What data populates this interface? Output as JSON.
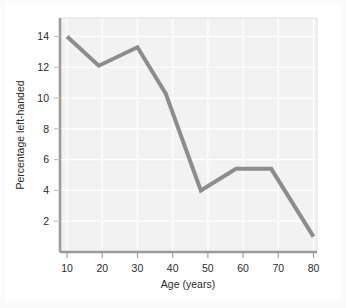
{
  "chart_data": {
    "type": "line",
    "title": "",
    "xlabel": "Age (years)",
    "ylabel": "Percentage left-handed",
    "xlim": [
      8,
      81
    ],
    "ylim": [
      0,
      15.2
    ],
    "xticks": [
      10,
      20,
      30,
      40,
      50,
      60,
      70,
      80
    ],
    "yticks": [
      2,
      4,
      6,
      8,
      10,
      12,
      14
    ],
    "xtick_labels": [
      "10",
      "20",
      "30",
      "40",
      "50",
      "60",
      "70",
      "80"
    ],
    "ytick_labels": [
      "2",
      "4",
      "6",
      "8",
      "10",
      "12",
      "14"
    ],
    "grid": true,
    "legend": "none",
    "series": [
      {
        "name": "Percentage left-handed",
        "x": [
          10,
          19,
          30,
          38,
          48,
          58,
          68,
          80
        ],
        "values": [
          14.0,
          12.1,
          13.3,
          10.3,
          4.0,
          5.4,
          5.4,
          1.0
        ]
      }
    ],
    "colors": {
      "line": "#8d8d8d",
      "plot_background": "#f2f2f2",
      "grid": "#ffffff",
      "axis": "#9a9a9a",
      "text": "#2b2b2b",
      "figure_background": "#fbfbfb",
      "card_background": "#ffffff"
    },
    "line_width": 4
  }
}
